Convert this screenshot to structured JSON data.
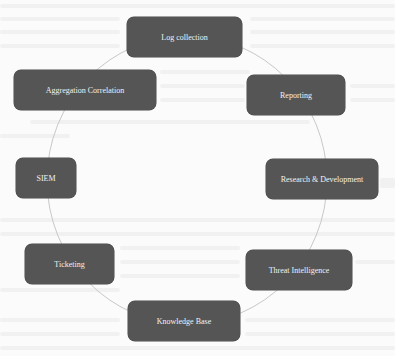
{
  "diagram": {
    "type": "cycle",
    "ring_color": "#c8c8c8",
    "node_fill": "#555555",
    "node_text_color": "#f2f2f2",
    "nodes": [
      {
        "id": "log-collection",
        "label": "Log collection"
      },
      {
        "id": "reporting",
        "label": "Reporting"
      },
      {
        "id": "research-development",
        "label": "Research & Development"
      },
      {
        "id": "threat-intelligence",
        "label": "Threat Intelligence"
      },
      {
        "id": "knowledge-base",
        "label": "Knowledge Base"
      },
      {
        "id": "ticketing",
        "label": "Ticketing"
      },
      {
        "id": "siem",
        "label": "SIEM"
      },
      {
        "id": "aggregation-correlation",
        "label": "Aggregation Correlation"
      }
    ]
  }
}
